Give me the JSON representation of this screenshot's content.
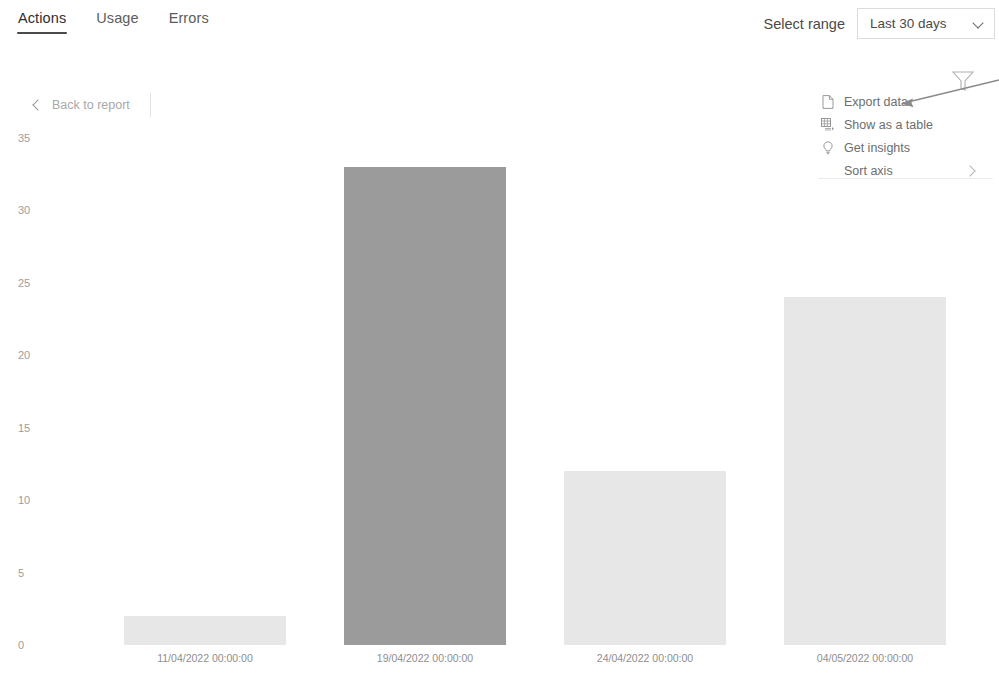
{
  "header": {
    "tabs": [
      {
        "label": "Actions",
        "selected": true
      },
      {
        "label": "Usage",
        "selected": false
      },
      {
        "label": "Errors",
        "selected": false
      }
    ],
    "range_label": "Select range",
    "range_value": "Last 30 days",
    "range_chevron_icon": "chevron-down-icon"
  },
  "toolbar": {
    "back_label": "Back to report",
    "back_icon": "chevron-left-icon"
  },
  "context_menu": {
    "items": [
      {
        "label": "Export data",
        "icon": "export-document-icon"
      },
      {
        "label": "Show as a table",
        "icon": "table-grid-icon"
      },
      {
        "label": "Get insights",
        "icon": "lightbulb-icon"
      }
    ],
    "sort_item": {
      "label": "Sort axis",
      "icon": "chevron-right-icon"
    },
    "filter_icon": "funnel-filter-icon"
  },
  "annotation": {
    "type": "arrow",
    "target": "Export data",
    "color": "#8a8a8a"
  },
  "colors": {
    "bar_default": "#e7e7e7",
    "bar_highlight": "#9b9b9b",
    "axis_text": "#9d9d9d",
    "tab_underline": "#4a4a4a",
    "border": "#dcdcdc"
  },
  "chart_data": {
    "type": "bar",
    "title": "",
    "xlabel": "",
    "ylabel": "",
    "categories": [
      "11/04/2022 00:00:00",
      "19/04/2022 00:00:00",
      "24/04/2022 00:00:00",
      "04/05/2022 00:00:00"
    ],
    "values": [
      2,
      33,
      12,
      24
    ],
    "highlighted_index": 1,
    "ylim": [
      0,
      35
    ],
    "yticks": [
      0,
      5,
      10,
      15,
      20,
      25,
      30,
      35
    ],
    "ytick_labels": [
      "0",
      "5",
      "10",
      "15",
      "20",
      "25",
      "30",
      "35"
    ],
    "grid": false,
    "legend": false
  }
}
